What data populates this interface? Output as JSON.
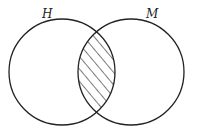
{
  "diagram": {
    "type": "venn",
    "sets": [
      {
        "id": "H",
        "label": "H",
        "cx": 62,
        "cy": 72,
        "r": 53
      },
      {
        "id": "M",
        "label": "M",
        "cx": 131,
        "cy": 72,
        "r": 53
      }
    ],
    "shaded_region": "H ∩ M",
    "shading_style": "diagonal-hatch",
    "colors": {
      "stroke": "#222222",
      "background": "#ffffff"
    }
  }
}
